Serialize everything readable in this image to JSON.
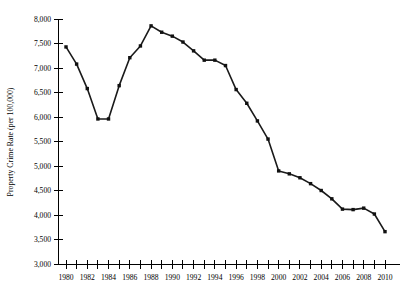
{
  "chart_data": {
    "type": "line",
    "title": "",
    "xlabel": "",
    "ylabel": "Property Crime Rate (per 100,000)",
    "xlim": [
      1980,
      2010
    ],
    "ylim": [
      3000,
      8000
    ],
    "grid": false,
    "legend": null,
    "y_tick_values": [
      3000,
      3500,
      4000,
      4500,
      5000,
      5500,
      6000,
      6500,
      7000,
      7500,
      8000
    ],
    "y_tick_labels": [
      "3,000",
      "3,500",
      "4,000",
      "4,500",
      "5,000",
      "5,500",
      "6,000",
      "6,500",
      "7,000",
      "7,500",
      "8,000"
    ],
    "x_tick_values": [
      1980,
      1981,
      1982,
      1983,
      1984,
      1985,
      1986,
      1987,
      1988,
      1989,
      1990,
      1991,
      1992,
      1993,
      1994,
      1995,
      1996,
      1997,
      1998,
      1999,
      2000,
      2001,
      2002,
      2003,
      2004,
      2005,
      2006,
      2007,
      2008,
      2009,
      2010
    ],
    "x_tick_labels": [
      "1980",
      "",
      "1982",
      "",
      "1984",
      "",
      "1986",
      "",
      "1988",
      "",
      "1990",
      "",
      "1992",
      "",
      "1994",
      "",
      "1996",
      "",
      "1998",
      "",
      "2000",
      "",
      "2002",
      "",
      "2004",
      "",
      "2006",
      "",
      "2008",
      "",
      "2010"
    ],
    "x": [
      1980,
      1981,
      1982,
      1983,
      1984,
      1985,
      1986,
      1987,
      1988,
      1989,
      1990,
      1991,
      1992,
      1993,
      1994,
      1995,
      1996,
      1997,
      1998,
      1999,
      2000,
      2001,
      2002,
      2003,
      2004,
      2005,
      2006,
      2007,
      2008,
      2009,
      2010
    ],
    "values": [
      7430,
      7080,
      6580,
      5960,
      5960,
      6640,
      7210,
      7450,
      7860,
      7730,
      7650,
      7530,
      7350,
      7160,
      7160,
      7050,
      6560,
      6280,
      5920,
      5550,
      4900,
      4840,
      4760,
      4640,
      4500,
      4330,
      4120,
      4110,
      4140,
      4020,
      3660
    ],
    "series": [
      {
        "name": "Property Crime Rate",
        "values": [
          7430,
          7080,
          6580,
          5960,
          5960,
          6640,
          7210,
          7450,
          7860,
          7730,
          7650,
          7530,
          7350,
          7160,
          7160,
          7050,
          6560,
          6280,
          5920,
          5550,
          4900,
          4840,
          4760,
          4640,
          4500,
          4330,
          4120,
          4110,
          4140,
          4020,
          3660
        ],
        "color": "#111111",
        "marker": "square"
      }
    ]
  },
  "plot": {
    "background_color": "#ffffff",
    "axis_color": "#000000",
    "line_color": "#111111"
  }
}
